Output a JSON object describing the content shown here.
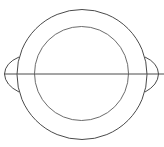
{
  "diagram": {
    "stroke_color": "#4a4a4a",
    "background": "#ffffff",
    "outer_rim": {
      "cx": 82,
      "cy": 74.5,
      "r": 65
    },
    "inner_rim": {
      "cx": 81.5,
      "cy": 73.5,
      "r": 47
    },
    "center_line": {
      "x1": 4,
      "y1": 74,
      "x2": 164,
      "y2": 74
    },
    "handles": [
      {
        "side": "left"
      },
      {
        "side": "right"
      }
    ]
  }
}
